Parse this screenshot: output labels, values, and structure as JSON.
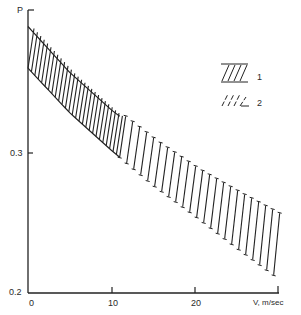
{
  "chart_data": {
    "type": "area",
    "title": "",
    "xlabel": "V, m/sec",
    "ylabel": "P",
    "x_ticks": [
      "0",
      "10",
      "20"
    ],
    "y_ticks": [
      "0.2",
      "0.3"
    ],
    "xlim": [
      0,
      30
    ],
    "ylim": [
      0.2,
      0.405
    ],
    "grid": false,
    "legend_position": "upper right",
    "legend": [
      {
        "label": "1",
        "pattern": "solid-diagonal-hatch"
      },
      {
        "label": "2",
        "pattern": "dashed-diagonal-hatch"
      }
    ],
    "series": [
      {
        "name": "upper boundary",
        "x": [
          0,
          5,
          10,
          15,
          20,
          25,
          30
        ],
        "values": [
          0.391,
          0.358,
          0.331,
          0.308,
          0.288,
          0.271,
          0.255
        ]
      },
      {
        "name": "lower boundary",
        "x": [
          0,
          5,
          10,
          15,
          20,
          25,
          30
        ],
        "values": [
          0.361,
          0.329,
          0.302,
          0.277,
          0.255,
          0.232,
          0.21
        ]
      }
    ],
    "regions": [
      {
        "legend": "1",
        "x_range": [
          0,
          11
        ]
      },
      {
        "legend": "2",
        "x_range": [
          11,
          30
        ]
      }
    ]
  }
}
